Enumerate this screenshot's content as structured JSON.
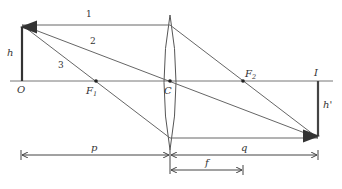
{
  "diagram": {
    "type": "thin converging lens ray diagram",
    "colors": {
      "ray": "#555555",
      "axis": "#666666",
      "arrow": "#333333",
      "lens": "#555555"
    },
    "labels": {
      "object_base": "O",
      "object_height": "h",
      "focal_point_1": "F",
      "focal_point_1_sub": "1",
      "center": "C",
      "focal_point_2": "F",
      "focal_point_2_sub": "2",
      "image_base": "I",
      "image_height": "h'",
      "object_distance": "p",
      "image_distance": "q",
      "focal_length": "f"
    },
    "rays": [
      {
        "label": "1",
        "description": "parallel to axis, refracts through F2"
      },
      {
        "label": "2",
        "description": "through center C, undeviated"
      },
      {
        "label": "3",
        "description": "through F1, exits parallel to axis"
      }
    ]
  }
}
